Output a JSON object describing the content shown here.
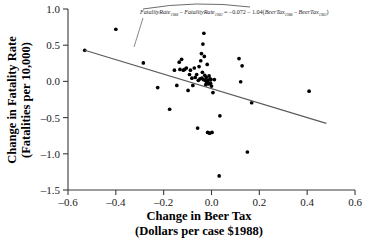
{
  "chart_data": {
    "type": "scatter",
    "title": "",
    "xlabel": "Change in Beer Tax",
    "xlabel_sub": "(Dollars per case $1988)",
    "ylabel": "Change in Fatality Rate",
    "ylabel_sub": "(Fatalities per 10,000)",
    "xlim": [
      -0.6,
      0.6
    ],
    "ylim": [
      -1.5,
      1.0
    ],
    "xticks": [
      "–0.6",
      "–0.4",
      "–0.2",
      "0.0",
      "0.2",
      "0.4",
      "0.6"
    ],
    "xtick_values": [
      -0.6,
      -0.4,
      -0.2,
      0.0,
      0.2,
      0.4,
      0.6
    ],
    "yticks": [
      "1.0",
      "0.5",
      "0.0",
      "–0.5",
      "–1.0",
      "–1.5"
    ],
    "ytick_values": [
      1.0,
      0.5,
      0.0,
      -0.5,
      -1.0,
      -1.5
    ],
    "grid": false,
    "legend": "none",
    "annotation": {
      "full_text": "FatalityRate1988 – FatalityRate1982 = –0.072 – 1.04(BeerTax1988 – BeerTax1982)",
      "term1": "FatalityRate",
      "term1_sub": "1988",
      "minus1": " – ",
      "term2": "FatalityRate",
      "term2_sub": "1982",
      "equals": " = ",
      "intercept": "–0.072",
      "minus2": " – ",
      "slope": "1.04",
      "open_paren": "(",
      "term3": "BeerTax",
      "term3_sub": "1988",
      "minus3": " – ",
      "term4": "BeerTax",
      "term4_sub": "1982",
      "close_paren": ")"
    },
    "regression": {
      "intercept": -0.072,
      "slope": -1.04,
      "x_start": -0.53,
      "y_start": 0.43,
      "x_end": 0.48,
      "y_end": -0.58
    },
    "points": [
      [
        -0.53,
        0.43
      ],
      [
        -0.4,
        0.72
      ],
      [
        -0.285,
        0.255
      ],
      [
        -0.225,
        -0.085
      ],
      [
        -0.175,
        -0.385
      ],
      [
        -0.155,
        0.155
      ],
      [
        -0.145,
        -0.055
      ],
      [
        -0.135,
        0.265
      ],
      [
        -0.132,
        0.165
      ],
      [
        -0.125,
        0.305
      ],
      [
        -0.118,
        0.155
      ],
      [
        -0.112,
        0.165
      ],
      [
        -0.105,
        0.185
      ],
      [
        -0.098,
        -0.125
      ],
      [
        -0.092,
        0.095
      ],
      [
        -0.088,
        0.155
      ],
      [
        -0.082,
        0.045
      ],
      [
        -0.078,
        -0.055
      ],
      [
        -0.072,
        0.185
      ],
      [
        -0.068,
        0.055
      ],
      [
        -0.062,
        0.095
      ],
      [
        -0.058,
        -0.645
      ],
      [
        -0.055,
        0.015
      ],
      [
        -0.052,
        0.205
      ],
      [
        -0.048,
        0.035
      ],
      [
        -0.045,
        0.285
      ],
      [
        -0.042,
        0.385
      ],
      [
        -0.04,
        0.045
      ],
      [
        -0.038,
        0.125
      ],
      [
        -0.036,
        0.515
      ],
      [
        -0.034,
        0.025
      ],
      [
        -0.032,
        0.665
      ],
      [
        -0.03,
        0.345
      ],
      [
        -0.028,
        0.085
      ],
      [
        -0.026,
        0.015
      ],
      [
        -0.024,
        -0.045
      ],
      [
        -0.022,
        0.055
      ],
      [
        -0.02,
        -0.015
      ],
      [
        -0.018,
        0.235
      ],
      [
        -0.016,
        -0.705
      ],
      [
        -0.014,
        0.015
      ],
      [
        -0.012,
        -0.035
      ],
      [
        -0.01,
        0.075
      ],
      [
        -0.008,
        -0.715
      ],
      [
        -0.006,
        0.035
      ],
      [
        -0.004,
        -0.025
      ],
      [
        -0.002,
        0.025
      ],
      [
        0.0,
        -0.065
      ],
      [
        0.002,
        -0.705
      ],
      [
        0.006,
        -0.155
      ],
      [
        0.012,
        0.025
      ],
      [
        0.032,
        -1.305
      ],
      [
        0.035,
        -0.475
      ],
      [
        0.115,
        0.315
      ],
      [
        0.122,
        -0.005
      ],
      [
        0.128,
        0.215
      ],
      [
        0.15,
        -0.975
      ],
      [
        0.168,
        -0.295
      ],
      [
        0.408,
        -0.135
      ]
    ]
  }
}
